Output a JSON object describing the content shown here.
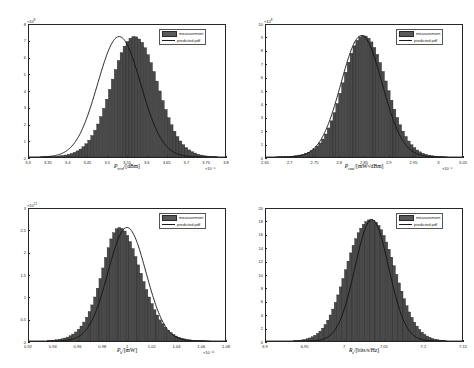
{
  "figure": {
    "background": "#ffffff",
    "bar_color": "#4a4a4a",
    "bar_edge_color": "#1f1f1f",
    "line_color": "#111111",
    "axis_color": "#262626"
  },
  "legend": {
    "measurement_label": "measurement",
    "predicted_label": "predicted pdf"
  },
  "chart_data": [
    {
      "id": "panel-top-left",
      "type": "bar",
      "title": "",
      "xlabel": "P_rcvd/[dBm]",
      "xlabel_base": "P",
      "xlabel_sub": "rcvd",
      "xlabel_unit": "/[dBm]",
      "ylabel": "",
      "xlim": [
        3.3,
        3.8
      ],
      "ylim": [
        0,
        8
      ],
      "x_exponent": "×10⁻⁶",
      "y_exponent": "×10⁸",
      "xticks": [
        "3.3",
        "3.35",
        "3.4",
        "3.45",
        "3.5",
        "3.55",
        "3.6",
        "3.65",
        "3.7",
        "3.75",
        "3.8"
      ],
      "yticks": [
        "0",
        "1",
        "2",
        "3",
        "4",
        "5",
        "6",
        "7",
        "8"
      ],
      "grid": false,
      "legend_position": "top-right",
      "peak_x": 3.53,
      "peak_y": 7.3,
      "sigma": 0.055,
      "bin_count": 60,
      "bin_start": 3.33,
      "bin_end": 3.78,
      "values": [
        0.01,
        0.015,
        0.02,
        0.025,
        0.035,
        0.05,
        0.07,
        0.09,
        0.12,
        0.16,
        0.21,
        0.28,
        0.37,
        0.48,
        0.62,
        0.8,
        1.02,
        1.3,
        1.62,
        2.0,
        2.45,
        2.95,
        3.5,
        4.1,
        4.72,
        5.3,
        5.85,
        6.32,
        6.72,
        7.0,
        7.2,
        7.3,
        7.28,
        7.15,
        6.95,
        6.62,
        6.2,
        5.72,
        5.18,
        4.6,
        4.0,
        3.42,
        2.88,
        2.38,
        1.95,
        1.56,
        1.24,
        0.97,
        0.75,
        0.57,
        0.43,
        0.32,
        0.24,
        0.17,
        0.12,
        0.085,
        0.06,
        0.04,
        0.025,
        0.015
      ]
    },
    {
      "id": "panel-top-right",
      "type": "bar",
      "title": "",
      "xlabel": "P_caus/[mW^a/dBm]",
      "xlabel_base": "P",
      "xlabel_sub": "caus",
      "xlabel_unit": "/[mWᵃ/dBm]",
      "ylabel": "",
      "xlim": [
        2.65,
        3.05
      ],
      "ylim": [
        0,
        10
      ],
      "x_exponent": "×10⁻⁶",
      "y_exponent": "×10⁸",
      "xticks": [
        "2.65",
        "2.7",
        "2.75",
        "2.8",
        "2.85",
        "2.9",
        "2.95",
        "3",
        "3.05"
      ],
      "yticks": [
        "0",
        "1",
        "2",
        "3",
        "4",
        "5",
        "6",
        "7",
        "8",
        "9",
        "10"
      ],
      "grid": false,
      "legend_position": "top-right",
      "peak_x": 2.845,
      "peak_y": 9.2,
      "sigma": 0.042,
      "bin_count": 60,
      "bin_start": 2.67,
      "bin_end": 3.02,
      "values": [
        0.01,
        0.015,
        0.022,
        0.03,
        0.042,
        0.06,
        0.082,
        0.11,
        0.15,
        0.2,
        0.27,
        0.36,
        0.48,
        0.63,
        0.82,
        1.06,
        1.36,
        1.74,
        2.2,
        2.74,
        3.36,
        4.06,
        4.82,
        5.62,
        6.42,
        7.18,
        7.86,
        8.42,
        8.84,
        9.1,
        9.2,
        9.16,
        9.0,
        8.72,
        8.3,
        7.78,
        7.16,
        6.48,
        5.76,
        5.02,
        4.3,
        3.62,
        3.0,
        2.44,
        1.96,
        1.55,
        1.21,
        0.93,
        0.71,
        0.53,
        0.39,
        0.28,
        0.2,
        0.14,
        0.1,
        0.07,
        0.048,
        0.032,
        0.02,
        0.013
      ]
    },
    {
      "id": "panel-bottom-left",
      "type": "bar",
      "title": "",
      "xlabel": "P_b/[mW]",
      "xlabel_base": "P",
      "xlabel_sub": "b",
      "xlabel_unit": "/[mW]",
      "ylabel": "",
      "xlim": [
        0.92,
        1.08
      ],
      "ylim": [
        0,
        3
      ],
      "x_exponent": "×10⁻¹¹",
      "y_exponent": "×10¹²",
      "xticks": [
        "0.92",
        "0.94",
        "0.96",
        "0.98",
        "1",
        "1.02",
        "1.04",
        "1.06",
        "1.08"
      ],
      "yticks": [
        "0",
        "0.5",
        "1",
        "1.5",
        "2",
        "2.5",
        "3"
      ],
      "grid": false,
      "legend_position": "top-right",
      "peak_x": 1.0,
      "peak_y": 2.58,
      "sigma": 0.0155,
      "bin_count": 60,
      "bin_start": 0.935,
      "bin_end": 1.068,
      "values": [
        0.01,
        0.014,
        0.02,
        0.027,
        0.037,
        0.05,
        0.068,
        0.09,
        0.12,
        0.158,
        0.205,
        0.266,
        0.34,
        0.43,
        0.54,
        0.67,
        0.82,
        1.0,
        1.2,
        1.42,
        1.66,
        1.9,
        2.12,
        2.32,
        2.46,
        2.55,
        2.58,
        2.56,
        2.5,
        2.4,
        2.26,
        2.1,
        1.92,
        1.73,
        1.54,
        1.35,
        1.17,
        1.0,
        0.85,
        0.71,
        0.59,
        0.48,
        0.39,
        0.31,
        0.245,
        0.19,
        0.148,
        0.113,
        0.086,
        0.065,
        0.048,
        0.036,
        0.026,
        0.019,
        0.014,
        0.01,
        0.007,
        0.005,
        0.0035,
        0.0025
      ]
    },
    {
      "id": "panel-bottom-right",
      "type": "bar",
      "title": "",
      "xlabel": "R_a/[bits/s/Hz]",
      "xlabel_base": "R",
      "xlabel_sub": "a",
      "xlabel_unit": "/[bits/s/Hz]",
      "ylabel": "",
      "xlim": [
        6.9,
        7.15
      ],
      "ylim": [
        0,
        20
      ],
      "x_exponent": "",
      "y_exponent": "",
      "xticks": [
        "6.9",
        "6.95",
        "7",
        "7.05",
        "7.1",
        "7.15"
      ],
      "yticks": [
        "0",
        "2",
        "4",
        "6",
        "8",
        "10",
        "12",
        "14",
        "16",
        "18",
        "20"
      ],
      "grid": false,
      "legend_position": "top-right",
      "peak_x": 7.035,
      "peak_y": 18.4,
      "sigma": 0.0215,
      "bin_count": 60,
      "bin_start": 6.935,
      "bin_end": 7.13,
      "values": [
        0.05,
        0.08,
        0.12,
        0.17,
        0.24,
        0.34,
        0.47,
        0.64,
        0.86,
        1.14,
        1.5,
        1.95,
        2.5,
        3.16,
        3.94,
        4.84,
        5.86,
        6.98,
        8.2,
        9.48,
        10.8,
        12.1,
        13.35,
        14.5,
        15.5,
        16.4,
        17.1,
        17.7,
        18.1,
        18.35,
        18.4,
        18.3,
        18.0,
        17.5,
        16.85,
        16.0,
        15.0,
        13.9,
        12.7,
        11.4,
        10.1,
        8.8,
        7.55,
        6.4,
        5.35,
        4.4,
        3.58,
        2.86,
        2.26,
        1.75,
        1.34,
        1.01,
        0.75,
        0.55,
        0.4,
        0.28,
        0.2,
        0.14,
        0.095,
        0.06
      ]
    }
  ]
}
